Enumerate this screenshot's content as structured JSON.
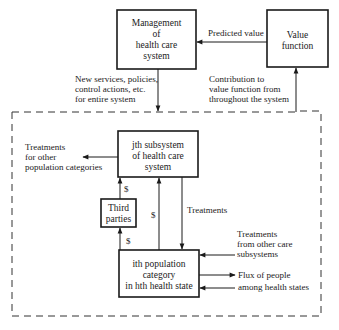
{
  "diagram": {
    "type": "flow-diagram",
    "boxes": {
      "management": {
        "lines": [
          "Management",
          "of",
          "health care",
          "system"
        ]
      },
      "value_function": {
        "lines": [
          "Value",
          "function"
        ]
      },
      "subsystem": {
        "lines": [
          "jth subsystem",
          "of health care",
          "system"
        ]
      },
      "third_parties": {
        "lines": [
          "Third",
          "parties"
        ]
      },
      "population": {
        "lines": [
          "ith population",
          "category",
          "in hth health state"
        ]
      }
    },
    "labels": {
      "predicted_value": "Predicted value",
      "new_services": [
        "New services, policies,",
        "control actions, etc.",
        "for entire system"
      ],
      "contribution": [
        "Contribution to",
        "value function from",
        "throughout the system"
      ],
      "treatments_other_pop": [
        "Treatments",
        "for other",
        "population categories"
      ],
      "dollar_third_to_sub": "$",
      "dollar_pop_to_sub": "$",
      "dollar_pop_to_third": "$",
      "treatments": "Treatments",
      "treatments_other_sub": [
        "Treatments",
        "from other care",
        "subsystems"
      ],
      "flux": [
        "Flux of people",
        "among health states"
      ]
    },
    "edges": [
      {
        "from": "value_function",
        "to": "management",
        "label": "Predicted value"
      },
      {
        "from": "management",
        "to": "dashed_system",
        "label": "New services, policies, control actions, etc. for entire system"
      },
      {
        "from": "dashed_system",
        "to": "value_function",
        "label": "Contribution to value function from throughout the system"
      },
      {
        "from": "subsystem",
        "to": "other_population_categories",
        "label": "Treatments for other population categories"
      },
      {
        "from": "third_parties",
        "to": "subsystem",
        "label": "$"
      },
      {
        "from": "population",
        "to": "third_parties",
        "label": "$"
      },
      {
        "from": "population",
        "to": "subsystem",
        "label": "$"
      },
      {
        "from": "subsystem",
        "to": "population",
        "label": "Treatments"
      },
      {
        "from": "other_care_subsystems",
        "to": "population",
        "label": "Treatments from other care subsystems"
      },
      {
        "from": "population",
        "to": "other_health_states",
        "label": "Flux of people among health states"
      },
      {
        "from": "other_health_states",
        "to": "population",
        "label": ""
      }
    ]
  }
}
